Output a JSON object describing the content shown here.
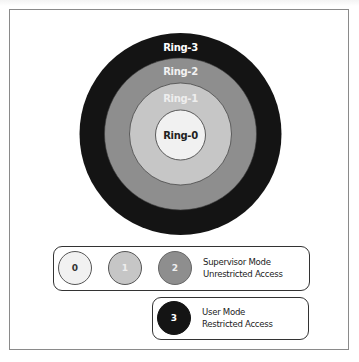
{
  "diagram": {
    "rings": [
      {
        "label": "Ring-3",
        "level": 3,
        "fill": "#141414",
        "text_color": "#ffffff"
      },
      {
        "label": "Ring-2",
        "level": 2,
        "fill": "#8e8e8e",
        "text_color": "#f2f2f2"
      },
      {
        "label": "Ring-1",
        "level": 1,
        "fill": "#c6c6c6",
        "text_color": "#eeeeee"
      },
      {
        "label": "Ring-0",
        "level": 0,
        "fill": "#f1f1f1",
        "text_color": "#222222"
      }
    ]
  },
  "legend": {
    "supervisor": {
      "levels": [
        {
          "label": "0",
          "fill": "#f1f1f1",
          "text_color": "#333333"
        },
        {
          "label": "1",
          "fill": "#c6c6c6",
          "text_color": "#eeeeee"
        },
        {
          "label": "2",
          "fill": "#8e8e8e",
          "text_color": "#eeeeee"
        }
      ],
      "line1": "Supervisor Mode",
      "line2": "Unrestricted Access"
    },
    "user": {
      "levels": [
        {
          "label": "3",
          "fill": "#141414",
          "text_color": "#ffffff"
        }
      ],
      "line1": "User Mode",
      "line2": "Restricted Access"
    }
  }
}
